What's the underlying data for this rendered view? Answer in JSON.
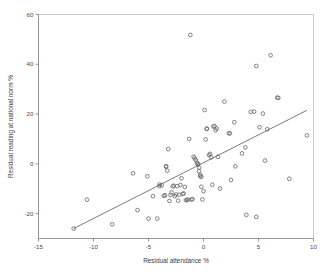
{
  "chart_data": {
    "type": "scatter",
    "title": "",
    "xlabel": "Residual attendance %",
    "ylabel": "Residual reading at national norm %",
    "xlim": [
      -15,
      10
    ],
    "ylim": [
      -30,
      60
    ],
    "xticks": [
      -15,
      -10,
      -5,
      0,
      5,
      10
    ],
    "xtick_labels": [
      "-15",
      "-10",
      "-5",
      "0",
      "5",
      "10"
    ],
    "yticks": [
      -20,
      0,
      20,
      40,
      60
    ],
    "ytick_labels": [
      "-20",
      "0",
      "20",
      "40",
      "60"
    ],
    "grid": false,
    "legend": false,
    "marker": "open-circle",
    "marker_color": "#6b6b6b",
    "line_color": "#5a5a5a",
    "axis_color": "#8a8a8a",
    "fit_line": {
      "label": "regression line",
      "x": [
        -11.8,
        9.4
      ],
      "y": [
        -26.0,
        21.5
      ]
    },
    "points": [
      [
        -11.8,
        -26.0
      ],
      [
        -10.6,
        -14.4
      ],
      [
        -8.3,
        -24.3
      ],
      [
        -6.4,
        -3.8
      ],
      [
        -6.0,
        -18.6
      ],
      [
        -5.1,
        -5.0
      ],
      [
        -5.0,
        -22.0
      ],
      [
        -4.6,
        -13.0
      ],
      [
        -4.2,
        -22.0
      ],
      [
        -4.0,
        -9.0
      ],
      [
        -4.0,
        -8.3
      ],
      [
        -3.8,
        -8.6
      ],
      [
        -3.6,
        -12.9
      ],
      [
        -3.5,
        -12.6
      ],
      [
        -3.4,
        -1.2
      ],
      [
        -3.4,
        -0.9
      ],
      [
        -3.3,
        -2.7
      ],
      [
        -3.2,
        5.9
      ],
      [
        -3.1,
        -14.9
      ],
      [
        -3.0,
        -12.5
      ],
      [
        -2.9,
        -11.5
      ],
      [
        -2.8,
        -9.0
      ],
      [
        -2.7,
        -8.8
      ],
      [
        -2.6,
        -13.0
      ],
      [
        -2.5,
        -12.3
      ],
      [
        -2.4,
        -9.0
      ],
      [
        -2.3,
        -14.8
      ],
      [
        -2.2,
        -12.4
      ],
      [
        -2.1,
        -8.5
      ],
      [
        -2.0,
        -5.8
      ],
      [
        -1.9,
        -12.1
      ],
      [
        -1.8,
        -11.9
      ],
      [
        -1.7,
        -9.3
      ],
      [
        -1.6,
        -14.6
      ],
      [
        -1.5,
        -14.5
      ],
      [
        -1.4,
        -14.4
      ],
      [
        -1.3,
        10.0
      ],
      [
        -1.2,
        51.8
      ],
      [
        -1.1,
        -14.3
      ],
      [
        -1.0,
        -14.2
      ],
      [
        -0.9,
        2.9
      ],
      [
        -0.8,
        2.2
      ],
      [
        -0.7,
        1.5
      ],
      [
        -0.6,
        0.4
      ],
      [
        -0.5,
        0.0
      ],
      [
        -0.5,
        -0.3
      ],
      [
        -0.4,
        -1.5
      ],
      [
        -0.4,
        -3.0
      ],
      [
        -0.3,
        -4.4
      ],
      [
        -0.3,
        -5.0
      ],
      [
        -0.2,
        -5.2
      ],
      [
        -0.2,
        -9.2
      ],
      [
        -0.1,
        -14.3
      ],
      [
        0.0,
        -11.0
      ],
      [
        0.1,
        21.6
      ],
      [
        0.2,
        9.8
      ],
      [
        0.3,
        14.0
      ],
      [
        0.3,
        14.2
      ],
      [
        0.5,
        3.6
      ],
      [
        0.6,
        4.0
      ],
      [
        0.7,
        2.6
      ],
      [
        0.8,
        -8.4
      ],
      [
        0.9,
        15.0
      ],
      [
        1.0,
        15.2
      ],
      [
        1.1,
        13.5
      ],
      [
        1.2,
        14.2
      ],
      [
        1.3,
        2.8
      ],
      [
        1.5,
        -9.9
      ],
      [
        1.9,
        25.0
      ],
      [
        2.3,
        12.3
      ],
      [
        2.4,
        12.2
      ],
      [
        2.5,
        -6.5
      ],
      [
        2.8,
        16.7
      ],
      [
        2.9,
        -1.0
      ],
      [
        3.5,
        4.2
      ],
      [
        3.8,
        6.6
      ],
      [
        3.9,
        -20.5
      ],
      [
        4.3,
        20.9
      ],
      [
        4.6,
        21.0
      ],
      [
        4.8,
        39.3
      ],
      [
        4.8,
        -21.3
      ],
      [
        5.1,
        14.7
      ],
      [
        5.4,
        20.2
      ],
      [
        5.6,
        1.3
      ],
      [
        5.8,
        13.9
      ],
      [
        6.1,
        43.6
      ],
      [
        6.7,
        26.6
      ],
      [
        6.8,
        26.5
      ],
      [
        7.8,
        -6.0
      ],
      [
        9.4,
        11.4
      ]
    ]
  }
}
